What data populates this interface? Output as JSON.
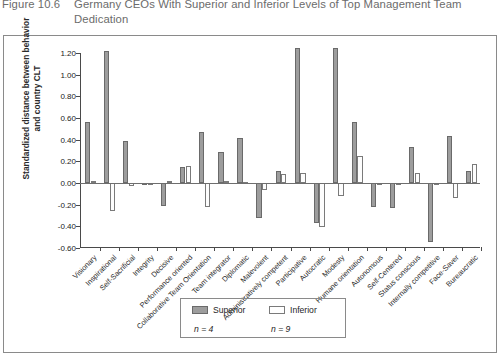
{
  "figure": {
    "number": "Figure 10.6",
    "title": "Germany CEOs With Superior and Inferior Levels of Top Management Team Dedication"
  },
  "legend": {
    "superior_label": "Superior",
    "inferior_label": "Inferior",
    "superior_n": "n = 4",
    "inferior_n": "n = 9",
    "superior_color": "#9d9d9d",
    "inferior_color": "#ffffff"
  },
  "chart_data": {
    "type": "bar",
    "title": "Germany CEOs With Superior and Inferior Levels of Top Management Team Dedication",
    "xlabel": "",
    "ylabel": "Standardized distance between behavior and country CLT",
    "ylim": [
      -0.6,
      1.2
    ],
    "ytick_step": 0.2,
    "ytick_labels": [
      "1.20",
      "1.00",
      "0.80",
      "0.60",
      "0.40",
      "0.20",
      "0.00",
      "-0.20",
      "-0.40",
      "-0.60"
    ],
    "ytick_values": [
      1.2,
      1.0,
      0.8,
      0.6,
      0.4,
      0.2,
      0.0,
      -0.2,
      -0.4,
      -0.6
    ],
    "grid": false,
    "legend_position": "bottom",
    "categories": [
      "Visionary",
      "Inspirational",
      "Self-Sacrificial",
      "Integrity",
      "Decisive",
      "Performance oriented",
      "Collaborative Team Orientation",
      "Team integrator",
      "Diplomatic",
      "Malevolent",
      "Administratively competent",
      "Participative",
      "Autocratic",
      "Modesty",
      "Humane orientation",
      "Autonomous",
      "Self-Centered",
      "Status conscious",
      "Internally competitive",
      "Face-Saver",
      "Bureaucratic"
    ],
    "series": [
      {
        "name": "Superior",
        "color": "#9d9d9d",
        "values": [
          0.56,
          1.22,
          0.39,
          -0.01,
          -0.21,
          0.15,
          0.47,
          0.29,
          0.42,
          -0.32,
          0.11,
          1.25,
          -0.37,
          1.25,
          0.56,
          -0.22,
          -0.23,
          0.33,
          -0.54,
          0.43,
          0.11
        ]
      },
      {
        "name": "Inferior",
        "color": "#ffffff",
        "values": [
          0.02,
          -0.26,
          -0.03,
          -0.02,
          0.02,
          0.16,
          -0.22,
          0.02,
          0.01,
          -0.06,
          0.08,
          0.09,
          -0.41,
          -0.12,
          0.25,
          -0.01,
          -0.01,
          0.09,
          0.0,
          -0.14,
          0.18
        ]
      }
    ]
  }
}
